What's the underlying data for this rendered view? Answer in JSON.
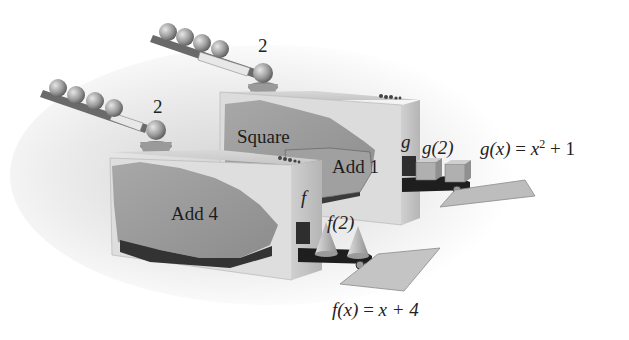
{
  "diagram": {
    "machine_g": {
      "input_value": "2",
      "stages": [
        "Square",
        "Add 1"
      ],
      "side_label": "g",
      "output_label": "g(2)",
      "formula_lhs": "g(x)",
      "formula_eq": "=",
      "formula_base": "x",
      "formula_exp": "2",
      "formula_rest": "+ 1",
      "output_shape": "cube"
    },
    "machine_f": {
      "input_value": "2",
      "stages": [
        "Add 4"
      ],
      "side_label": "f",
      "output_label": "f(2)",
      "formula_lhs": "f(x)",
      "formula_eq": "=",
      "formula_rhs": "x + 4",
      "output_shape": "cone"
    },
    "colors": {
      "background": "#ffffff",
      "machine_face": "#d9d9d9",
      "torn_panel": "#9a9a9a",
      "shadow": "#3a3a3a",
      "text": "#222222"
    }
  }
}
